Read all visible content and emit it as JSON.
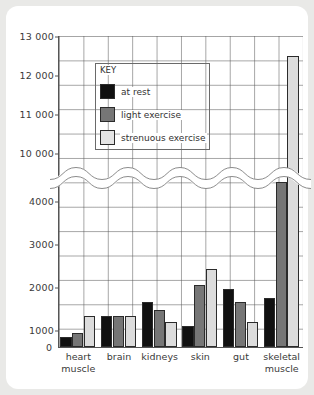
{
  "chart_data": {
    "type": "bar",
    "title": "",
    "xlabel": "",
    "ylabel": "",
    "categories": [
      "heart\nmuscle",
      "brain",
      "kidneys",
      "skin",
      "gut",
      "skeletal\nmuscle"
    ],
    "series": [
      {
        "name": "at rest",
        "color": "#111111",
        "values": [
          250,
          750,
          1100,
          500,
          1400,
          1200
        ]
      },
      {
        "name": "light exercise",
        "color": "#767676",
        "values": [
          350,
          750,
          900,
          1500,
          1100,
          4500
        ]
      },
      {
        "name": "strenuous exercise",
        "color": "#dcdcdc",
        "values": [
          750,
          750,
          600,
          1900,
          600,
          12500
        ]
      }
    ],
    "y_ticks_lower": [
      "0",
      "1000",
      "2000",
      "3000",
      "4000"
    ],
    "y_ticks_upper": [
      "10 000",
      "11 000",
      "12 000",
      "13 000"
    ],
    "y_axis_break": true,
    "ylim_lower": [
      0,
      4000
    ],
    "ylim_upper": [
      10000,
      13000
    ],
    "grid": true,
    "legend_position": "upper-left-inset"
  },
  "legend": {
    "title": "KEY",
    "entries": [
      {
        "label": "at rest"
      },
      {
        "label": "light exercise"
      },
      {
        "label": "strenuous exercise"
      }
    ]
  },
  "axis": {
    "zero": "0",
    "ticks": [
      {
        "label": "13 000"
      },
      {
        "label": "12 000"
      },
      {
        "label": "11 000"
      },
      {
        "label": "10 000"
      },
      {
        "label": "4000"
      },
      {
        "label": "3000"
      },
      {
        "label": "2000"
      },
      {
        "label": "1000"
      }
    ]
  }
}
